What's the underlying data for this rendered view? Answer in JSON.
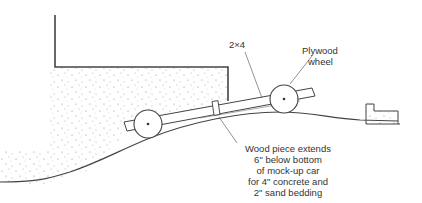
{
  "diagram": {
    "labels": {
      "beam": "2×4",
      "wheel_line1": "Plywood",
      "wheel_line2": "wheel",
      "wood_line1": "Wood piece extends",
      "wood_line2": "6\" below bottom",
      "wood_line3": "of mock-up car",
      "wood_line4": "for 4\" concrete and",
      "wood_line5": "2\" sand bedding"
    },
    "colors": {
      "line": "#444444",
      "stipple": "#8a8a8a",
      "text": "#333333"
    }
  }
}
